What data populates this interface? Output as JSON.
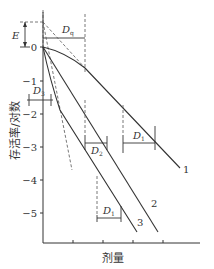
{
  "diagram": {
    "type": "survival-curve-diagram",
    "y_axis": {
      "label": "存活率/对数",
      "ticks": [
        "0",
        "−1",
        "−2",
        "−3",
        "−4",
        "−5"
      ]
    },
    "x_axis": {
      "label": "剂量"
    },
    "annotations": {
      "E": "E",
      "Dq": "D",
      "Dq_sub": "q",
      "D0_1": "D",
      "D0_1_sub": "1",
      "D0_2": "D",
      "D0_2_sub": "2",
      "D0_3": "D",
      "D0_3_sub": "3",
      "D1_bottom": "D",
      "D1_bottom_sub": "1"
    },
    "curves": [
      {
        "id": "1",
        "label": "1"
      },
      {
        "id": "2",
        "label": "2"
      },
      {
        "id": "3",
        "label": "3"
      }
    ]
  }
}
